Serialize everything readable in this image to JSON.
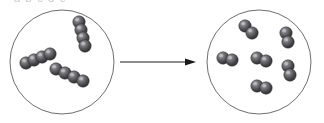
{
  "figure": {
    "clipped_caption": "a  b  c  d  e",
    "background_color": "#ffffff"
  },
  "style": {
    "circle_stroke": "#6e6e6e",
    "circle_fill": "#ffffff",
    "circle_stroke_width": 1,
    "atom_dark": "#3a3a3c",
    "atom_mid": "#58585b",
    "atom_light": "#8e8e92",
    "atom_highlight": "#c9c9cd",
    "atom_outline": "#2b2b2d",
    "shadow_color": "#b9b9bd",
    "arrow_color": "#1a1a1a"
  },
  "arrow": {
    "name": "reaction-arrow",
    "x1": 120,
    "y1": 62,
    "x2": 196,
    "y2": 62,
    "stroke_width": 1,
    "head_length": 11,
    "head_width": 7,
    "direction": "right"
  },
  "reactant_container": {
    "label": "reactant-flask",
    "cx": 62,
    "cy": 62,
    "r": 52,
    "molecule_count": 3,
    "atoms_per_molecule": 4,
    "molecule_type": "tetratomic-chain"
  },
  "product_container": {
    "label": "product-flask",
    "cx": 259,
    "cy": 62,
    "r": 52,
    "molecule_count": 6,
    "atoms_per_molecule": 2,
    "molecule_type": "diatomic"
  },
  "chart_data": {
    "type": "diagram",
    "reactant_molecule_count": 3,
    "reactant_atoms_per_molecule": 4,
    "reactant_total_atoms": 12,
    "product_molecule_count": 6,
    "product_atoms_per_molecule": 2,
    "product_total_atoms": 12,
    "balanced": true,
    "equation": "3 A4 -> 6 A2"
  },
  "reactant_molecules": [
    {
      "name": "molecule-left-lower",
      "atom_count": 4,
      "angle_deg": -22,
      "atoms": [
        {
          "cx": 26,
          "cy": 63,
          "r": 6.2
        },
        {
          "cx": 34,
          "cy": 60,
          "r": 6.2
        },
        {
          "cx": 42,
          "cy": 57,
          "r": 6.2
        },
        {
          "cx": 50,
          "cy": 54,
          "r": 6.2
        }
      ],
      "shadow": {
        "cx": 36,
        "cy": 70,
        "rx": 22,
        "ry": 7,
        "angle": -22
      }
    },
    {
      "name": "molecule-top-right",
      "atom_count": 4,
      "angle_deg": 74,
      "atoms": [
        {
          "cx": 79,
          "cy": 22,
          "r": 6.2
        },
        {
          "cx": 81,
          "cy": 30,
          "r": 6.2
        },
        {
          "cx": 83,
          "cy": 38,
          "r": 6.2
        },
        {
          "cx": 85,
          "cy": 46,
          "r": 6.2
        }
      ],
      "shadow": {
        "cx": 76,
        "cy": 38,
        "rx": 20,
        "ry": 7,
        "angle": 74
      }
    },
    {
      "name": "molecule-bottom-center",
      "atom_count": 4,
      "angle_deg": 19,
      "atoms": [
        {
          "cx": 56,
          "cy": 69,
          "r": 6.2
        },
        {
          "cx": 65,
          "cy": 73,
          "r": 6.2
        },
        {
          "cx": 74,
          "cy": 77,
          "r": 6.2
        },
        {
          "cx": 83,
          "cy": 81,
          "r": 6.2
        }
      ],
      "shadow": {
        "cx": 70,
        "cy": 86,
        "rx": 24,
        "ry": 7,
        "angle": 19
      }
    }
  ],
  "product_molecules": [
    {
      "name": "molecule-product-top-left",
      "atom_count": 2,
      "atoms": [
        {
          "cx": 245,
          "cy": 26,
          "r": 6.2
        },
        {
          "cx": 252,
          "cy": 33,
          "r": 6.2
        }
      ],
      "shadow": {
        "cx": 244,
        "cy": 38,
        "rx": 17,
        "ry": 6,
        "angle": 30
      }
    },
    {
      "name": "molecule-product-top-right",
      "atom_count": 2,
      "atoms": [
        {
          "cx": 286,
          "cy": 33,
          "r": 6.2
        },
        {
          "cx": 288,
          "cy": 42,
          "r": 6.2
        }
      ],
      "shadow": {
        "cx": 283,
        "cy": 46,
        "rx": 15,
        "ry": 6,
        "angle": 70
      }
    },
    {
      "name": "molecule-product-left",
      "atom_count": 2,
      "atoms": [
        {
          "cx": 223,
          "cy": 58,
          "r": 6.2
        },
        {
          "cx": 232,
          "cy": 60,
          "r": 6.2
        }
      ],
      "shadow": {
        "cx": 225,
        "cy": 67,
        "rx": 17,
        "ry": 6,
        "angle": 8
      }
    },
    {
      "name": "molecule-product-center",
      "atom_count": 2,
      "atoms": [
        {
          "cx": 257,
          "cy": 58,
          "r": 6.2
        },
        {
          "cx": 266,
          "cy": 61,
          "r": 6.2
        }
      ],
      "shadow": {
        "cx": 259,
        "cy": 68,
        "rx": 18,
        "ry": 6,
        "angle": 14
      }
    },
    {
      "name": "molecule-product-right",
      "atom_count": 2,
      "atoms": [
        {
          "cx": 288,
          "cy": 66,
          "r": 6.2
        },
        {
          "cx": 290,
          "cy": 75,
          "r": 6.2
        }
      ],
      "shadow": {
        "cx": 285,
        "cy": 79,
        "rx": 15,
        "ry": 6,
        "angle": 70
      }
    },
    {
      "name": "molecule-product-bottom",
      "atom_count": 2,
      "atoms": [
        {
          "cx": 257,
          "cy": 86,
          "r": 6.2
        },
        {
          "cx": 266,
          "cy": 88,
          "r": 6.2
        }
      ],
      "shadow": {
        "cx": 259,
        "cy": 95,
        "rx": 18,
        "ry": 6,
        "angle": 8
      }
    }
  ]
}
